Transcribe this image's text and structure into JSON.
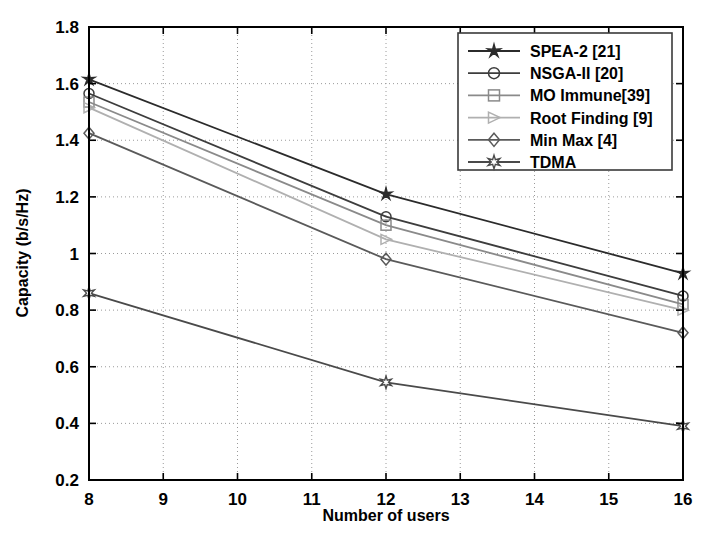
{
  "chart_data": {
    "type": "line",
    "title": "",
    "xlabel": "Number of users",
    "ylabel": "Capacity (b/s/Hz)",
    "xlim": [
      8,
      16
    ],
    "ylim": [
      0.2,
      1.8
    ],
    "xticks": [
      8,
      9,
      10,
      11,
      12,
      13,
      14,
      15,
      16
    ],
    "xtick_labels": [
      "8",
      "9",
      "10",
      "11",
      "12",
      "13",
      "14",
      "15",
      "16"
    ],
    "yticks": [
      0.2,
      0.4,
      0.6,
      0.8,
      1.0,
      1.2,
      1.4,
      1.6,
      1.8
    ],
    "ytick_labels": [
      "0.2",
      "0.4",
      "0.6",
      "0.8",
      "1",
      "1.2",
      "1.4",
      "1.6",
      "1.8"
    ],
    "grid": true,
    "grid_style": "dotted",
    "legend_position": "top-right",
    "x": [
      8,
      12,
      16
    ],
    "series": [
      {
        "name": "SPEA-2 [21]",
        "marker": "star",
        "color": "#2b2b2b",
        "values": [
          1.615,
          1.21,
          0.93
        ]
      },
      {
        "name": "NSGA-II [20]",
        "marker": "circle",
        "color": "#3d3d3d",
        "values": [
          1.565,
          1.13,
          0.85
        ]
      },
      {
        "name": "MO Immune[39]",
        "marker": "square",
        "color": "#8a8a8a",
        "values": [
          1.535,
          1.1,
          0.82
        ]
      },
      {
        "name": "Root Finding [9]",
        "marker": "triangle-right",
        "color": "#b0b0b0",
        "values": [
          1.515,
          1.05,
          0.8
        ]
      },
      {
        "name": "Min Max [4]",
        "marker": "diamond",
        "color": "#5a5a5a",
        "values": [
          1.425,
          0.98,
          0.72
        ]
      },
      {
        "name": "TDMA",
        "marker": "hexagram",
        "color": "#4a4a4a",
        "values": [
          0.86,
          0.545,
          0.39
        ]
      }
    ]
  },
  "axes": {
    "x_title": "Number of users",
    "y_title": "Capacity (b/s/Hz)"
  },
  "legend": {
    "items": [
      {
        "label": "SPEA-2 [21]"
      },
      {
        "label": "NSGA-II [20]"
      },
      {
        "label": "MO Immune[39]"
      },
      {
        "label": "Root Finding [9]"
      },
      {
        "label": "Min Max [4]"
      },
      {
        "label": "TDMA"
      }
    ]
  }
}
